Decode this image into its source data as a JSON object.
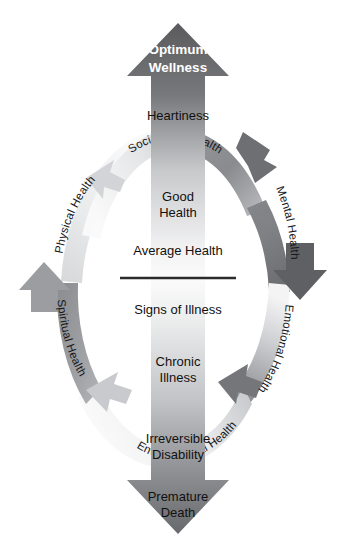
{
  "diagram": {
    "type": "wellness-continuum-diagram",
    "background_color": "#ffffff"
  },
  "colors": {
    "dark_gray": "#5b5b5d",
    "mid_gray": "#8f9093",
    "light_gray": "#d8d9db",
    "near_white": "#fafafa",
    "text_dark": "#111111",
    "text_light": "#ffffff",
    "divider": "#2b2b2b"
  },
  "vertical_axis": {
    "name": "wellness-continuum-axis",
    "direction": "bidirectional-vertical",
    "top_tip": {
      "label_line1": "Optimum",
      "label_line2": "Wellness",
      "text_color": "#ffffff",
      "emphasis": "bold"
    },
    "bottom_tip": {
      "label_line1": "Premature",
      "label_line2": "Death",
      "text_color": "#111111"
    },
    "upper_half_stages": [
      {
        "label": "Heartiness"
      },
      {
        "label_line1": "Good",
        "label_line2": "Health"
      },
      {
        "label": "Average Health"
      }
    ],
    "lower_half_stages": [
      {
        "label": "Signs of Illness"
      },
      {
        "label_line1": "Chronic",
        "label_line2": "Illness"
      },
      {
        "label_line1": "Irreversible",
        "label_line2": "Disability"
      }
    ],
    "neutral_point_divider": true
  },
  "ring": {
    "name": "dimensions-of-health-ring",
    "segments": [
      {
        "id": "social-health",
        "label": "Social",
        "label_full": "Social Health",
        "position": "top-center-left",
        "tone": "light"
      },
      {
        "id": "health-top-right",
        "label": "Health",
        "label_full": "Social Health",
        "position": "top-center-right",
        "tone": "mid"
      },
      {
        "id": "mental-health",
        "label": "Mental Health",
        "position": "right-upper",
        "tone": "mid"
      },
      {
        "id": "emotional-health",
        "label": "Emotional Health",
        "position": "right-lower",
        "tone": "mid"
      },
      {
        "id": "environmental-health",
        "label": "Environmental Health",
        "position": "bottom-center",
        "tone": "light"
      },
      {
        "id": "spiritual-health",
        "label": "Spiritual Health",
        "position": "left-lower",
        "tone": "mid"
      },
      {
        "id": "physical-health",
        "label": "Physical Health",
        "position": "left-upper",
        "tone": "light"
      }
    ],
    "arrowheads": [
      {
        "id": "ring-arrow-top-left",
        "points": "left"
      },
      {
        "id": "ring-arrow-top-right",
        "points": "down"
      },
      {
        "id": "ring-arrow-bottom-right",
        "points": "left"
      },
      {
        "id": "ring-arrow-bottom-left",
        "points": "left"
      },
      {
        "id": "ring-arrow-west",
        "points": "up"
      },
      {
        "id": "ring-arrow-east",
        "points": "down"
      }
    ]
  }
}
